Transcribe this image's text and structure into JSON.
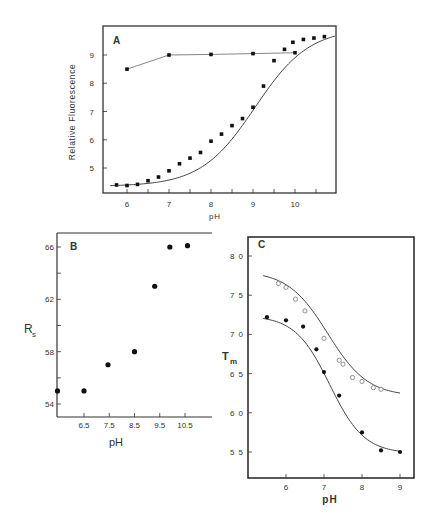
{
  "chart_data": [
    {
      "panel": "A",
      "type": "scatter",
      "title": "A",
      "xlabel": "pH",
      "ylabel": "Relative Fluorescence",
      "xlim": [
        5.6,
        11.1
      ],
      "ylim": [
        4.3,
        10.0
      ],
      "xticks": [
        "6",
        "7",
        "8",
        "9",
        "10"
      ],
      "yticks": [
        "5",
        "6",
        "7",
        "8",
        "9"
      ],
      "grid": false,
      "series": [
        {
          "name": "upper (flat)",
          "style": "markers + connecting line",
          "x": [
            6.0,
            7.0,
            8.0,
            9.0,
            10.0
          ],
          "y": [
            8.5,
            9.0,
            9.02,
            9.05,
            9.08
          ]
        },
        {
          "name": "lower (sigmoidal)",
          "style": "markers + smooth fitted curve",
          "x": [
            5.75,
            6.0,
            6.25,
            6.5,
            6.75,
            7.0,
            7.25,
            7.5,
            7.75,
            8.0,
            8.25,
            8.5,
            8.75,
            9.0,
            9.25,
            9.5,
            9.75,
            9.95,
            10.2,
            10.45,
            10.7
          ],
          "y": [
            4.4,
            4.38,
            4.42,
            4.55,
            4.68,
            4.9,
            5.15,
            5.35,
            5.55,
            5.95,
            6.2,
            6.5,
            6.75,
            7.15,
            7.9,
            8.8,
            9.2,
            9.45,
            9.55,
            9.6,
            9.65
          ]
        }
      ]
    },
    {
      "panel": "B",
      "type": "scatter",
      "title": "B",
      "xlabel": "pH",
      "ylabel": "Rs",
      "xlim": [
        5.45,
        11.3
      ],
      "ylim": [
        53,
        67
      ],
      "xticks": [
        "6.5",
        "7.5",
        "8.5",
        "9.5",
        "10.5"
      ],
      "yticks": [
        "54",
        "58",
        "62",
        "66"
      ],
      "grid": false,
      "series": [
        {
          "name": "Rs",
          "x": [
            5.45,
            6.5,
            7.45,
            8.5,
            9.3,
            9.9,
            10.6
          ],
          "y": [
            55,
            55,
            57,
            58,
            63,
            66,
            66.1
          ]
        }
      ]
    },
    {
      "panel": "C",
      "type": "scatter",
      "title": "C",
      "xlabel": "pH",
      "ylabel": "Tm",
      "xlim": [
        5.0,
        9.35
      ],
      "ylim": [
        51.5,
        82.5
      ],
      "xticks": [
        "6",
        "7",
        "8",
        "9"
      ],
      "yticks": [
        "5 5",
        "6 0",
        "6 5",
        "7 0",
        "7 5",
        "8 0"
      ],
      "grid": false,
      "series": [
        {
          "name": "open circles",
          "marker": "open",
          "x": [
            5.8,
            6.0,
            6.25,
            6.5,
            7.0,
            7.4,
            7.5,
            7.75,
            8.0,
            8.3,
            8.5
          ],
          "y": [
            76.5,
            76.0,
            74.5,
            73.0,
            69.5,
            66.7,
            66.2,
            64.5,
            64.0,
            63.2,
            63.0
          ],
          "fit": "sigmoid from ~77.5 at pH 5.4 to ~62.3 at pH 9"
        },
        {
          "name": "filled circles",
          "marker": "filled",
          "x": [
            5.5,
            6.0,
            6.45,
            6.8,
            7.0,
            7.4,
            8.0,
            8.5,
            9.0
          ],
          "y": [
            72.2,
            71.8,
            71.0,
            68.1,
            65.2,
            62.2,
            57.5,
            55.2,
            55.0
          ],
          "fit": "sigmoid from ~72.5 at pH 5.4 to ~55 at pH 9"
        }
      ]
    }
  ],
  "labels": {
    "panelA": "A",
    "panelB": "B",
    "panelC": "C",
    "xA": "pH",
    "yA": "Relative Fluorescence",
    "xB": "pH",
    "yB_main": "R",
    "yB_sub": "s",
    "xC": "pH",
    "yC_main": "T",
    "yC_sub": "m"
  }
}
